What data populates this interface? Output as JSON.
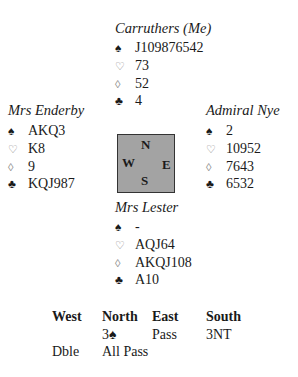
{
  "symbols": {
    "spades": "♠",
    "hearts": "♡",
    "diamonds": "◊",
    "clubs": "♣"
  },
  "hands": {
    "north": {
      "name": "Carruthers (Me)",
      "spades": "J109876542",
      "hearts": "73",
      "diamonds": "52",
      "clubs": "4"
    },
    "west": {
      "name": "Mrs Enderby",
      "spades": "AKQ3",
      "hearts": "K8",
      "diamonds": "9",
      "clubs": "KQJ987"
    },
    "east": {
      "name": "Admiral Nye",
      "spades": "2",
      "hearts": "10952",
      "diamonds": "7643",
      "clubs": "6532"
    },
    "south": {
      "name": "Mrs Lester",
      "spades": "-",
      "hearts": "AQJ64",
      "diamonds": "AKQJ108",
      "clubs": "A10"
    }
  },
  "compass": {
    "n": "N",
    "w": "W",
    "e": "E",
    "s": "S",
    "fill": "#a3a3a3",
    "border": "#333333"
  },
  "bidding": {
    "headers": [
      "West",
      "North",
      "East",
      "South"
    ],
    "rows": [
      [
        "",
        "3♠",
        "Pass",
        "3NT"
      ],
      [
        "Dble",
        "All Pass",
        "",
        ""
      ]
    ]
  }
}
